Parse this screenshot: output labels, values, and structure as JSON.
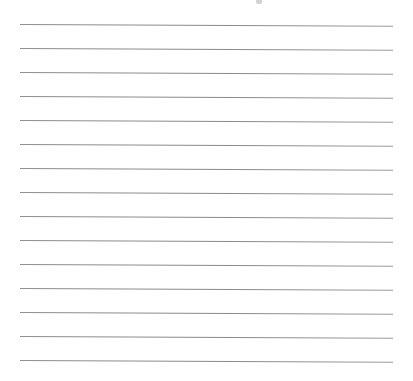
{
  "page": {
    "type": "lined-paper",
    "background_color": "#ffffff",
    "line_color": "#8c8c8c",
    "line_count": 15,
    "line_spacing_px": 24,
    "line_left_px": 20,
    "line_right_px": 393,
    "first_line_y_px": 24,
    "top_mark_visible": true
  },
  "lines": [
    {
      "index": 1,
      "y": 24
    },
    {
      "index": 2,
      "y": 48
    },
    {
      "index": 3,
      "y": 72
    },
    {
      "index": 4,
      "y": 96
    },
    {
      "index": 5,
      "y": 120
    },
    {
      "index": 6,
      "y": 144
    },
    {
      "index": 7,
      "y": 168
    },
    {
      "index": 8,
      "y": 192
    },
    {
      "index": 9,
      "y": 216
    },
    {
      "index": 10,
      "y": 240
    },
    {
      "index": 11,
      "y": 264
    },
    {
      "index": 12,
      "y": 288
    },
    {
      "index": 13,
      "y": 312
    },
    {
      "index": 14,
      "y": 336
    },
    {
      "index": 15,
      "y": 360
    }
  ]
}
